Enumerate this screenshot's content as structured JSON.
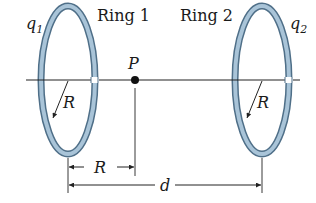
{
  "diagram": {
    "ring1": {
      "label": "Ring 1",
      "charge_label": "q",
      "charge_sub": "1",
      "radius_label": "R"
    },
    "ring2": {
      "label": "Ring 2",
      "charge_label": "q",
      "charge_sub": "2",
      "radius_label": "R"
    },
    "point": {
      "label": "P"
    },
    "dimensions": {
      "ring1_to_P": "R",
      "ring1_to_ring2": "d"
    },
    "colors": {
      "ring_fill": "#a9c4d8",
      "ring_edge": "#4f6f88",
      "line": "#222222"
    }
  }
}
